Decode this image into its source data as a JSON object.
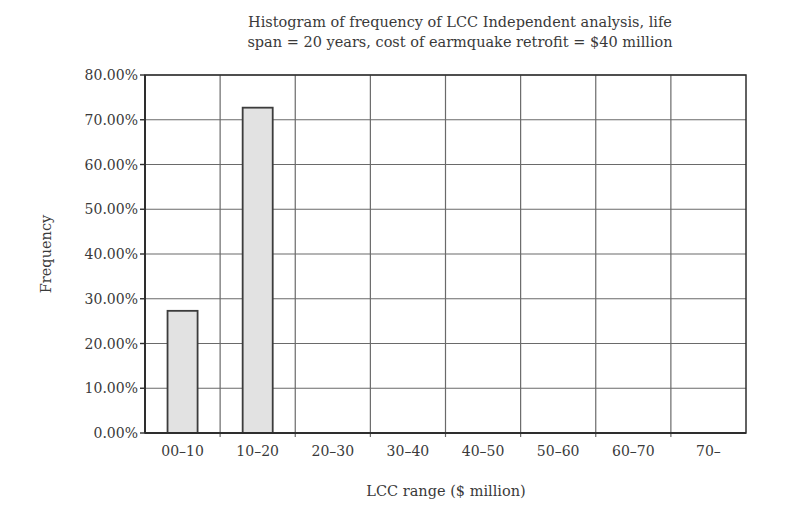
{
  "chart_data": {
    "type": "bar",
    "title": "Histogram of frequency of LCC Independent analysis, life span = 20 years, cost of earmquake retrofit = $40 million",
    "title_lines": [
      "Histogram of frequency of LCC Independent analysis, life",
      "span = 20 years, cost of earmquake retrofit = $40 million"
    ],
    "xlabel": "LCC range ($ million)",
    "ylabel": "Frequency",
    "categories": [
      "00–10",
      "10–20",
      "20–30",
      "30–40",
      "40–50",
      "50–60",
      "60–70",
      "70–"
    ],
    "values": [
      27.3,
      72.7,
      0,
      0,
      0,
      0,
      0,
      0
    ],
    "value_unit": "%",
    "ylim": [
      0,
      80
    ],
    "yticks": [
      0,
      10,
      20,
      30,
      40,
      50,
      60,
      70,
      80
    ],
    "ytick_labels": [
      "0.00%",
      "10.00%",
      "20.00%",
      "30.00%",
      "40.00%",
      "50.00%",
      "60.00%",
      "70.00%",
      "80.00%"
    ],
    "grid": true,
    "legend": null,
    "colors": {
      "bar_fill": "#e2e2e2",
      "bar_stroke": "#3c3c3c",
      "grid": "#6a6a6a",
      "axis": "#2e2e2e"
    }
  }
}
